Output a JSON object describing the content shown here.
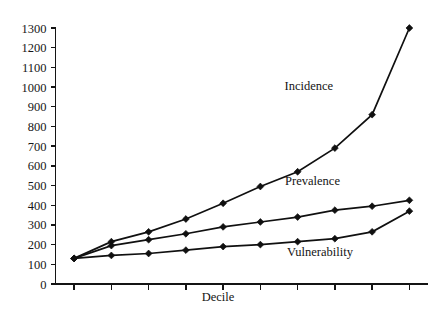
{
  "chart_data": {
    "type": "line",
    "title": "",
    "xlabel": "Decile",
    "ylabel": "",
    "x": [
      1,
      2,
      3,
      4,
      5,
      6,
      7,
      8,
      9,
      10
    ],
    "categories": [
      "1",
      "2",
      "3",
      "4",
      "5",
      "6",
      "7",
      "8",
      "9",
      "10"
    ],
    "xlim": [
      0.5,
      10.5
    ],
    "ylim": [
      0,
      1300
    ],
    "ytick_labels": [
      "0",
      "100",
      "200",
      "300",
      "400",
      "500",
      "600",
      "700",
      "800",
      "900",
      "1000",
      "1100",
      "1200",
      "1300"
    ],
    "ytick_values": [
      0,
      100,
      200,
      300,
      400,
      500,
      600,
      700,
      800,
      900,
      1000,
      1100,
      1200,
      1300
    ],
    "xtick_labels": [
      "",
      "",
      "",
      "",
      "",
      "",
      "",
      "",
      "",
      ""
    ],
    "grid": false,
    "legend": "inline-annotations",
    "marker": "diamond",
    "line_color": "#101010",
    "series": [
      {
        "name": "Incidence",
        "values": [
          130,
          215,
          265,
          330,
          410,
          495,
          570,
          690,
          860,
          1300
        ],
        "label_x": 7.3,
        "label_y": 985
      },
      {
        "name": "Prevalence",
        "values": [
          130,
          195,
          225,
          255,
          290,
          315,
          340,
          375,
          395,
          425
        ],
        "label_x": 7.4,
        "label_y": 505
      },
      {
        "name": "Vulnerability",
        "values": [
          130,
          145,
          155,
          172,
          190,
          200,
          215,
          230,
          265,
          370
        ],
        "label_x": 7.6,
        "label_y": 140
      }
    ],
    "annotations": [
      {
        "text": "Incidence"
      },
      {
        "text": "Prevalence"
      },
      {
        "text": "Vulnerability"
      }
    ]
  }
}
